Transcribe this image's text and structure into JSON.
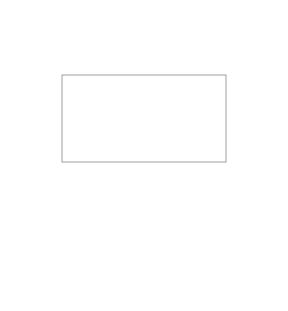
{
  "figure": {
    "top_panel": {
      "shape": "heart",
      "zoom_box": {
        "x": 62,
        "y": 75,
        "w": 164,
        "h": 87
      }
    },
    "bottom_panel": {
      "shape": "inverted-triangle-magnified",
      "ladder_rungs": 6
    },
    "colors": {
      "sphere_dark": "#707070",
      "sphere_light": "#d8d8d8",
      "frame": "#a0a0a0",
      "background": "#ffffff"
    }
  }
}
